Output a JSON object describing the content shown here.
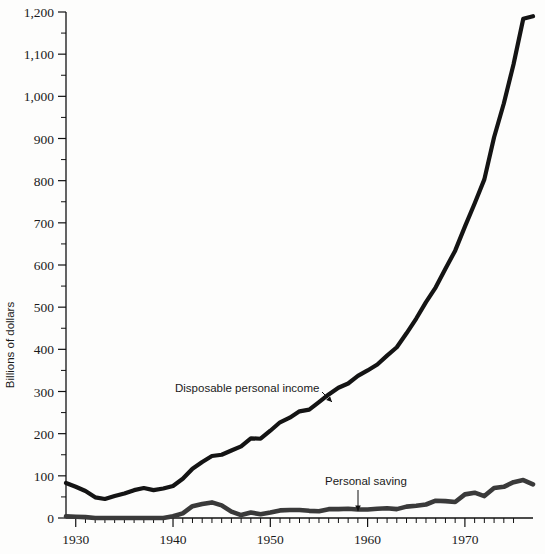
{
  "chart_data": {
    "type": "line",
    "title": "",
    "xlabel": "",
    "ylabel": "Billions of dollars",
    "xlim": [
      1929,
      1977
    ],
    "ylim": [
      0,
      1200
    ],
    "grid": false,
    "legend_position": "inline-annotations",
    "y_ticks_major": [
      0,
      100,
      200,
      300,
      400,
      500,
      600,
      700,
      800,
      900,
      1000,
      1100,
      1200
    ],
    "y_tick_labels": [
      "0",
      "100",
      "200",
      "300",
      "400",
      "500",
      "600",
      "700",
      "800",
      "900",
      "1,000",
      "1,100",
      "1,200"
    ],
    "y_ticks_minor_step": 50,
    "x_ticks_major": [
      1930,
      1940,
      1950,
      1960,
      1970
    ],
    "x_tick_labels": [
      "1930",
      "1940",
      "1950",
      "1960",
      "1970"
    ],
    "x_ticks_minor_step": 1,
    "x": [
      1929,
      1930,
      1931,
      1932,
      1933,
      1934,
      1935,
      1936,
      1937,
      1938,
      1939,
      1940,
      1941,
      1942,
      1943,
      1944,
      1945,
      1946,
      1947,
      1948,
      1949,
      1950,
      1951,
      1952,
      1953,
      1954,
      1955,
      1956,
      1957,
      1958,
      1959,
      1960,
      1961,
      1962,
      1963,
      1964,
      1965,
      1966,
      1967,
      1968,
      1969,
      1970,
      1971,
      1972,
      1973,
      1974,
      1975,
      1976,
      1977
    ],
    "series": [
      {
        "name": "Disposable personal income",
        "color": "#141414",
        "stroke_width": 4.2,
        "annotation": "Disposable personal income",
        "values": [
          83,
          74,
          64,
          49,
          45,
          52,
          58,
          66,
          71,
          66,
          70,
          76,
          93,
          117,
          133,
          147,
          150,
          160,
          170,
          189,
          188,
          207,
          227,
          238,
          253,
          257,
          275,
          293,
          309,
          319,
          337,
          350,
          364,
          385,
          405,
          438,
          473,
          512,
          547,
          591,
          634,
          691,
          746,
          803,
          903,
          983,
          1076,
          1184,
          1190
        ]
      },
      {
        "name": "Personal saving",
        "color": "#3a3a3a",
        "stroke_width": 4.6,
        "annotation": "Personal saving",
        "values": [
          4,
          3,
          2,
          0,
          0,
          0,
          0,
          0,
          0,
          0,
          0,
          4,
          11,
          28,
          33,
          37,
          30,
          15,
          7,
          13,
          9,
          13,
          18,
          19,
          19,
          17,
          16,
          21,
          21,
          22,
          20,
          20,
          22,
          23,
          21,
          27,
          29,
          32,
          41,
          40,
          38,
          56,
          60,
          52,
          71,
          74,
          85,
          90,
          80
        ]
      }
    ],
    "annotations": [
      {
        "name": "disposable-personal-income",
        "text": "Disposable personal income",
        "text_x": 175,
        "text_y": 392,
        "leader_from_x": 322,
        "leader_from_y": 392,
        "leader_to_x": 332,
        "leader_to_y": 402
      },
      {
        "name": "personal-saving",
        "text": "Personal saving",
        "text_x": 325,
        "text_y": 485,
        "leader_from_x": 358,
        "leader_from_y": 490,
        "leader_to_x": 358,
        "leader_to_y": 511
      }
    ],
    "colors": {
      "background": "#fdfdfc",
      "axis": "#111111",
      "text": "#1a1a1a",
      "income_line": "#141414",
      "saving_line": "#3a3a3a"
    }
  }
}
